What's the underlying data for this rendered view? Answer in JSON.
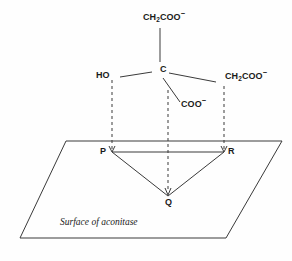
{
  "figure": {
    "background_color": "#fefefe",
    "line_color": "#3a3a3a"
  },
  "molecule": {
    "center_atom": {
      "label": "C",
      "name": "central-carbon"
    },
    "substituents": [
      {
        "name": "upper-ch2coo",
        "text_html": "CH<sub>2</sub>COO<sup>−</sup>",
        "plain": "CH2COO-",
        "position": "top"
      },
      {
        "name": "hydroxyl",
        "text_html": "HO",
        "plain": "HO",
        "position": "left"
      },
      {
        "name": "right-ch2coo",
        "text_html": "CH<sub>2</sub>COO<sup>−</sup>",
        "plain": "CH2COO-",
        "position": "right"
      },
      {
        "name": "carboxylate",
        "text_html": "COO<sup>−</sup>",
        "plain": "COO-",
        "position": "bottom"
      }
    ]
  },
  "surface": {
    "caption": "Surface of aconitase",
    "binding_points": [
      {
        "label": "P",
        "name": "binding-point-p"
      },
      {
        "label": "Q",
        "name": "binding-point-q"
      },
      {
        "label": "R",
        "name": "binding-point-r"
      }
    ]
  },
  "chart_data": {
    "type": "diagram",
    "title": "Surface of aconitase",
    "nodes": [
      {
        "id": "C",
        "x": 160,
        "y": 70,
        "label": "C"
      },
      {
        "id": "CH2COO_t",
        "x": 160,
        "y": 18,
        "label": "CH2COO-"
      },
      {
        "id": "HO",
        "x": 112,
        "y": 75,
        "label": "HO"
      },
      {
        "id": "CH2COO_r",
        "x": 224,
        "y": 76,
        "label": "CH2COO-"
      },
      {
        "id": "COO_b",
        "x": 180,
        "y": 104,
        "label": "COO-"
      },
      {
        "id": "P",
        "x": 112,
        "y": 152,
        "label": "P"
      },
      {
        "id": "Q",
        "x": 168,
        "y": 196,
        "label": "Q"
      },
      {
        "id": "R",
        "x": 224,
        "y": 152,
        "label": "R"
      }
    ],
    "bonds": [
      {
        "from": "C",
        "to": "CH2COO_t",
        "style": "solid"
      },
      {
        "from": "C",
        "to": "HO",
        "style": "solid"
      },
      {
        "from": "C",
        "to": "CH2COO_r",
        "style": "solid"
      },
      {
        "from": "C",
        "to": "COO_b",
        "style": "solid"
      }
    ],
    "projections": [
      {
        "from": "HO",
        "to": "P",
        "style": "dashed"
      },
      {
        "from": "COO_b",
        "to": "Q",
        "style": "dashed"
      },
      {
        "from": "CH2COO_r",
        "to": "R",
        "style": "dashed"
      }
    ],
    "triangle": [
      "P",
      "R",
      "Q"
    ],
    "plane": {
      "points": "66,141 282,141 226,238 20,238"
    }
  }
}
